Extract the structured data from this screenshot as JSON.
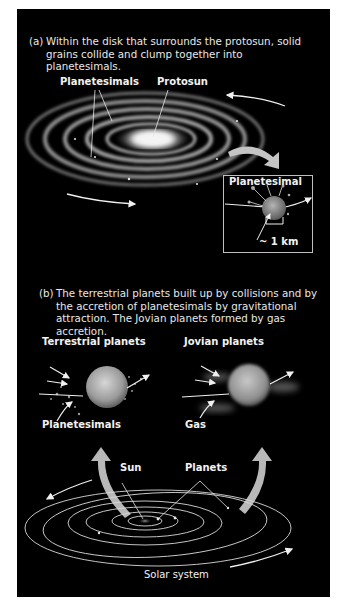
{
  "figure": {
    "panel_a": {
      "tag": "(a)",
      "caption": "Within the disk that surrounds the protosun, solid grains collide and clump together into planetesimals.",
      "labels": {
        "planetesimals": "Planetesimals",
        "protosun": "Protosun",
        "planetesimal_inset": "Planetesimal",
        "scale": "~ 1 km"
      }
    },
    "panel_b": {
      "tag": "(b)",
      "caption": "The terrestrial planets built up by collisions and by the accretion of planetesimals by gravitational attraction. The Jovian planets formed by gas accretion.",
      "labels": {
        "terrestrial_planets": "Terrestrial planets",
        "jovian_planets": "Jovian planets",
        "planetesimals": "Planetesimals",
        "gas": "Gas",
        "sun": "Sun",
        "planets": "Planets",
        "solar_system": "Solar system"
      }
    },
    "colors": {
      "background": "#000000",
      "text": "#f2f2f2",
      "big_arrow": "#b8b8b8",
      "orbit_line": "#d9d9d9"
    }
  }
}
